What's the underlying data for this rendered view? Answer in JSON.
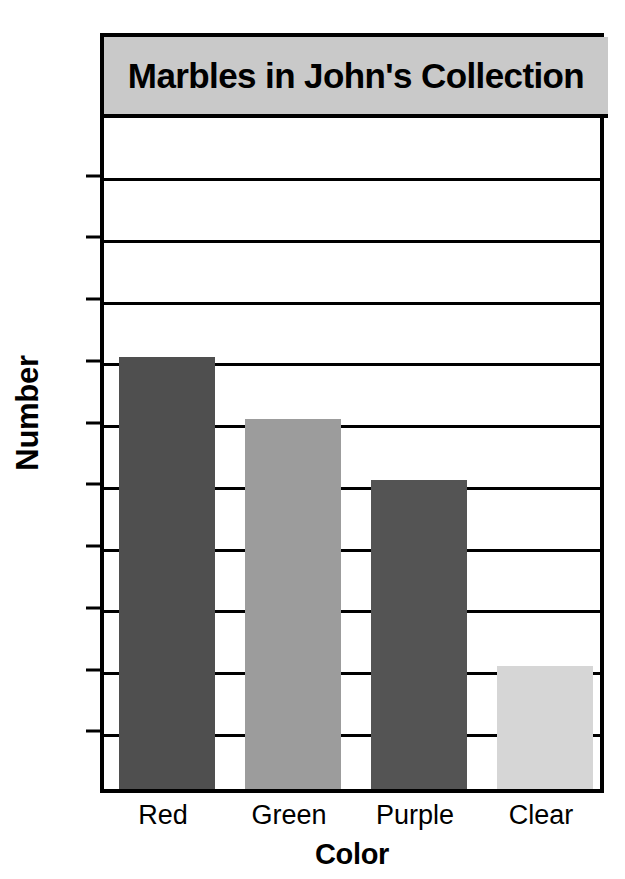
{
  "chart_data": {
    "type": "bar",
    "title": "Marbles in John's Collection",
    "xlabel": "Color",
    "ylabel": "Number",
    "categories": [
      "Red",
      "Green",
      "Purple",
      "Clear"
    ],
    "values": [
      14,
      12,
      10,
      4
    ],
    "bar_colors": [
      "#4f4f4f",
      "#9c9c9c",
      "#545454",
      "#d6d6d6"
    ],
    "ylim": [
      0,
      22
    ],
    "ytick_labels": [
      "0",
      "2",
      "4",
      "6",
      "8",
      "10",
      "12",
      "14",
      "16",
      "18",
      "20",
      "22"
    ],
    "ytick_values": [
      0,
      2,
      4,
      6,
      8,
      10,
      12,
      14,
      16,
      18,
      20,
      22
    ],
    "grid": true,
    "grid_axis": "y",
    "legend": "none",
    "title_background": "#c9c9c9",
    "frame_color": "#000000",
    "background": "#ffffff"
  }
}
